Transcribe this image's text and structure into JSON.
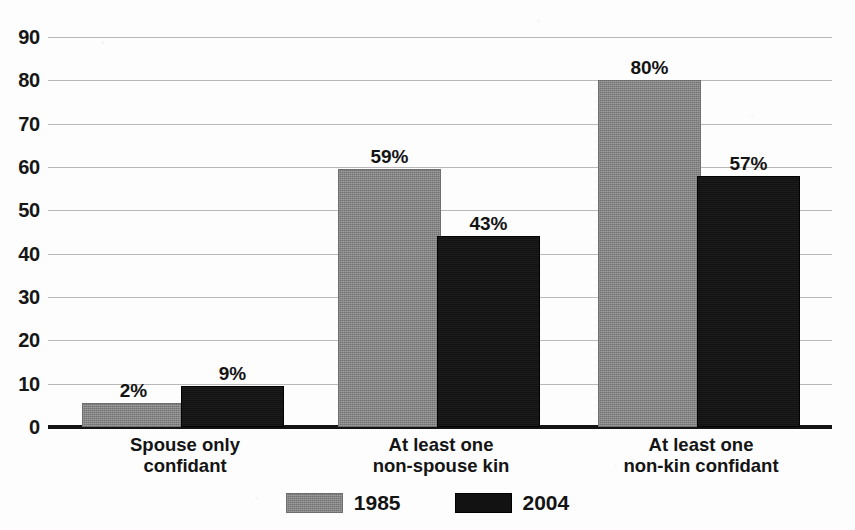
{
  "chart_data": {
    "type": "bar",
    "title": "",
    "xlabel": "",
    "ylabel": "",
    "ylim": [
      0,
      90
    ],
    "ytick_step": 10,
    "yticks": [
      "90",
      "80",
      "70",
      "60",
      "50",
      "40",
      "30",
      "20",
      "10",
      "0"
    ],
    "grid": true,
    "legend_position": "bottom-center",
    "categories": [
      "Spouse only confidant",
      "At least one non-spouse kin",
      "At least one non-kin confidant"
    ],
    "category_lines": [
      {
        "line1": "Spouse only",
        "line2": "confidant"
      },
      {
        "line1": "At least one",
        "line2": "non-spouse kin"
      },
      {
        "line1": "At least one",
        "line2": "non-kin confidant"
      }
    ],
    "series": [
      {
        "name": "1985",
        "color": "#8a8a8a",
        "values": [
          2,
          59,
          80
        ],
        "labels": [
          "2%",
          "9%",
          "59%"
        ],
        "value_labels": [
          "2%",
          "59%",
          "80%"
        ],
        "drawn_heights": [
          5.5,
          59.5,
          80
        ]
      },
      {
        "name": "2004",
        "color": "#121212",
        "values": [
          9,
          43,
          57
        ],
        "value_labels": [
          "9%",
          "43%",
          "57%"
        ],
        "drawn_heights": [
          9.5,
          44,
          58
        ]
      }
    ],
    "legend": [
      {
        "label": "1985",
        "color": "#8a8a8a"
      },
      {
        "label": "2004",
        "color": "#121212"
      }
    ]
  },
  "colors": {
    "series_1985": "#8a8a8a",
    "series_2004": "#121212",
    "gridline": "#b9b9b9",
    "axis": "#141414",
    "background": "#fdfdfd"
  }
}
